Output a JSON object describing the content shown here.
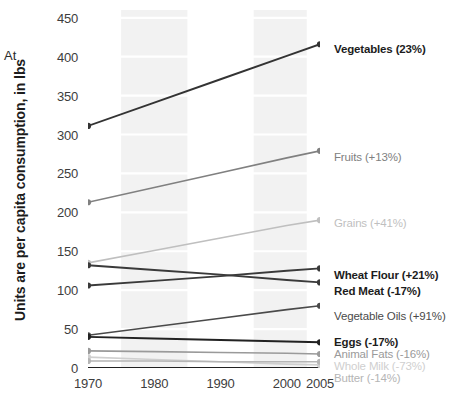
{
  "corner_note": "At",
  "chart_data": {
    "type": "line",
    "title": "",
    "xlabel": "",
    "ylabel": "Units are per capita consumption, in lbs",
    "x": [
      1970,
      1980,
      1990,
      2000,
      2005
    ],
    "xticklabels": [
      "1970",
      "1980",
      "1990",
      "2000",
      "2005"
    ],
    "xlim": [
      1970,
      2005
    ],
    "ylim": [
      0,
      460
    ],
    "yticks": [
      0,
      50,
      100,
      150,
      200,
      250,
      300,
      350,
      400,
      450
    ],
    "yticklabels": [
      "0",
      "50",
      "100",
      "150",
      "200",
      "250",
      "300",
      "350",
      "400",
      "450"
    ],
    "grid": "horizontal-faint-banded",
    "legend": "right-of-line-end",
    "series": [
      {
        "name": "Vegetables",
        "label": "Vegetables (23%)",
        "change": "23%",
        "color": "#333333",
        "emphasis": "bold",
        "start_value": 311,
        "end_value": 416,
        "values": [
          311,
          341,
          371,
          401,
          416
        ]
      },
      {
        "name": "Fruits",
        "label": "Fruits (+13%)",
        "change": "+13%",
        "color": "#808080",
        "emphasis": "normal",
        "start_value": 213,
        "end_value": 279,
        "values": [
          213,
          232,
          251,
          270,
          279
        ]
      },
      {
        "name": "Grains",
        "label": "Grains (+41%)",
        "change": "+41%",
        "color": "#bfbfbf",
        "emphasis": "normal",
        "start_value": 135,
        "end_value": 190,
        "values": [
          135,
          151,
          167,
          183,
          190
        ]
      },
      {
        "name": "Wheat Flour",
        "label": "Wheat Flour (+21%)",
        "change": "+21%",
        "color": "#3a3a3a",
        "emphasis": "bold",
        "start_value": 106,
        "end_value": 128,
        "values": [
          106,
          112,
          118,
          125,
          128
        ]
      },
      {
        "name": "Red Meat",
        "label": "Red Meat (-17%)",
        "change": "-17%",
        "color": "#3a3a3a",
        "emphasis": "bold",
        "start_value": 132,
        "end_value": 110,
        "values": [
          132,
          126,
          120,
          113,
          110
        ]
      },
      {
        "name": "Vegetable Oils",
        "label": "Vegetable Oils (+91%)",
        "change": "+91%",
        "color": "#4a4a4a",
        "emphasis": "normal",
        "start_value": 42,
        "end_value": 80,
        "values": [
          42,
          53,
          64,
          75,
          80
        ]
      },
      {
        "name": "Eggs",
        "label": "Eggs (-17%)",
        "change": "-17%",
        "color": "#222222",
        "emphasis": "bold",
        "start_value": 40,
        "end_value": 33,
        "values": [
          40,
          38,
          36,
          34,
          33
        ]
      },
      {
        "name": "Animal Fats",
        "label": "Animal Fats (-16%)",
        "change": "-16%",
        "color": "#9a9a9a",
        "emphasis": "normal",
        "start_value": 22,
        "end_value": 18,
        "values": [
          22,
          21,
          20,
          19,
          18
        ]
      },
      {
        "name": "Whole Milk",
        "label": "Whole Milk (-73%)",
        "change": "-73%",
        "color": "#cfcfcf",
        "emphasis": "normal",
        "start_value": 14,
        "end_value": 4,
        "values": [
          14,
          11,
          8,
          5,
          4
        ]
      },
      {
        "name": "Butter",
        "label": "Butter (-14%)",
        "change": "-14%",
        "color": "#b5b5b5",
        "emphasis": "normal",
        "start_value": 9,
        "end_value": 8,
        "values": [
          9,
          9,
          8,
          8,
          8
        ]
      }
    ]
  },
  "colors": {
    "axis": "#222222",
    "tick_text": "#3d3d3d",
    "band": "#ededed",
    "background": "#ffffff"
  }
}
